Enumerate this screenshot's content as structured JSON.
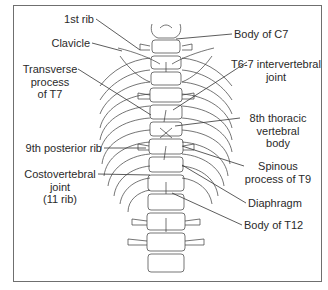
{
  "figure": {
    "colors": {
      "line": "#333333",
      "frame": "#6f6f6f",
      "text": "#2a2a2a"
    },
    "labels_left": [
      {
        "id": "first-rib",
        "lines": [
          "1st rib"
        ]
      },
      {
        "id": "clavicle",
        "lines": [
          "Clavicle"
        ]
      },
      {
        "id": "transverse-process-t7",
        "lines": [
          "Transverse",
          "process",
          "of T7"
        ]
      },
      {
        "id": "ninth-posterior-rib",
        "lines": [
          "9th posterior rib"
        ]
      },
      {
        "id": "costovertebral-joint",
        "lines": [
          "Costovertebral",
          "joint",
          "(11 rib)"
        ]
      }
    ],
    "labels_right": [
      {
        "id": "body-of-c7",
        "lines": [
          "Body of C7"
        ]
      },
      {
        "id": "t6-7-intervertebral-joint",
        "lines": [
          "T6-7 intervertebral",
          "joint"
        ]
      },
      {
        "id": "eighth-thoracic-vertebral-body",
        "lines": [
          "8th thoracic",
          "vertebral",
          "body"
        ]
      },
      {
        "id": "spinous-process-t9",
        "lines": [
          "Spinous",
          "process of T9"
        ]
      },
      {
        "id": "diaphragm",
        "lines": [
          "Diaphragm"
        ]
      },
      {
        "id": "body-of-t12",
        "lines": [
          "Body of T12"
        ]
      }
    ]
  }
}
